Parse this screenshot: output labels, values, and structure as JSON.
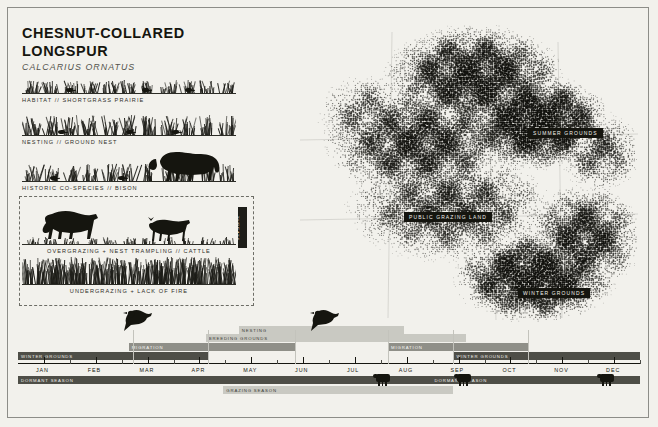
{
  "poster": {
    "title": "CHESNUT-COLLARED LONGSPUR",
    "subtitle": "CALCARIUS ORNATUS",
    "background_color": "#f2f1ec",
    "ink_color": "#15150f"
  },
  "strips": [
    {
      "caption": "HABITAT // SHORTGRASS PRAIRIE",
      "icon": "shortgrass-prairie-icon"
    },
    {
      "caption": "NESTING // GROUND NEST",
      "icon": "ground-nest-icon"
    },
    {
      "caption": "HISTORIC CO-SPECIES // BISON",
      "icon": "bison-icon"
    },
    {
      "caption": "OVERGRAZING + NEST TRAMPLING // CATTLE",
      "icon": "cattle-icon"
    },
    {
      "caption": "UNDERGRAZING + LACK OF FIRE",
      "icon": "tallgrass-icon"
    }
  ],
  "threats": {
    "tab_label": "THREATS"
  },
  "map": {
    "labels": [
      {
        "text": "SUMMER GROUNDS",
        "x": 228,
        "y": 106
      },
      {
        "text": "PUBLIC GRAZING LAND",
        "x": 104,
        "y": 190
      },
      {
        "text": "WINTER GROUNDS",
        "x": 218,
        "y": 266
      }
    ]
  },
  "timeline": {
    "months": [
      "JAN",
      "FEB",
      "MAR",
      "APR",
      "MAY",
      "JUN",
      "JUL",
      "AUG",
      "SEP",
      "OCT",
      "NOV",
      "DEC"
    ],
    "bars": [
      {
        "label": "WINTER GROUNDS",
        "start": 0,
        "end": 30.5,
        "row": 0,
        "tone": "dark"
      },
      {
        "label": "MIGRATION",
        "start": 17.8,
        "end": 44.5,
        "row": 1,
        "tone": "mid"
      },
      {
        "label": "BREEDING GROUNDS",
        "start": 30.2,
        "end": 72.0,
        "row": 2,
        "tone": "light"
      },
      {
        "label": "NESTING",
        "start": 35.5,
        "end": 62.0,
        "row": 3,
        "tone": "light"
      },
      {
        "label": "MIGRATION",
        "start": 59.5,
        "end": 82.0,
        "row": 1,
        "tone": "mid"
      },
      {
        "label": "WINTER GROUNDS",
        "start": 70.0,
        "end": 100,
        "row": 0,
        "tone": "dark"
      },
      {
        "label": "DORMANT SEASON",
        "start": 0,
        "end": 66.5,
        "row": 4,
        "tone": "dark"
      },
      {
        "label": "GRAZING SEASON",
        "start": 33.0,
        "end": 70.0,
        "row": 5,
        "tone": "light"
      },
      {
        "label": "DORMANT SEASON",
        "start": 66.5,
        "end": 100,
        "row": 4,
        "tone": "dark"
      }
    ],
    "cattle_markers": [
      57.5,
      70.5,
      93.5
    ],
    "bird_markers": [
      18.5,
      48.5
    ]
  }
}
